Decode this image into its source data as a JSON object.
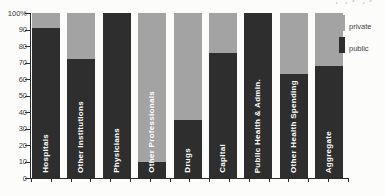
{
  "chart_data": {
    "type": "bar",
    "stacked": true,
    "percent_scale": true,
    "categories": [
      "Hospitals",
      "Other Institutions",
      "Physicians",
      "Other Professionals",
      "Drugs",
      "Capital",
      "Public Health & Admin.",
      "Other Health Spending",
      "Aggregate"
    ],
    "series": [
      {
        "name": "public",
        "color": "#2e2e2e",
        "values": [
          91,
          72,
          100,
          10,
          35,
          76,
          100,
          63,
          68
        ]
      },
      {
        "name": "private",
        "color": "#a3a3a3",
        "values": [
          9,
          28,
          0,
          90,
          65,
          24,
          0,
          37,
          32
        ]
      }
    ],
    "title": "",
    "xlabel": "",
    "ylabel": "",
    "ylim": [
      0,
      100
    ],
    "yticks": [
      "100%",
      "90",
      "80",
      "70",
      "60",
      "50",
      "40",
      "30",
      "20",
      "10",
      "0"
    ],
    "grid": false,
    "legend_position": "right",
    "legend_entries": [
      "private",
      "public"
    ]
  },
  "legend": {
    "private_label": "private",
    "public_label": "public"
  },
  "cropped_top_text": "ˏ ˏ ⁄ ˏ ⁄"
}
